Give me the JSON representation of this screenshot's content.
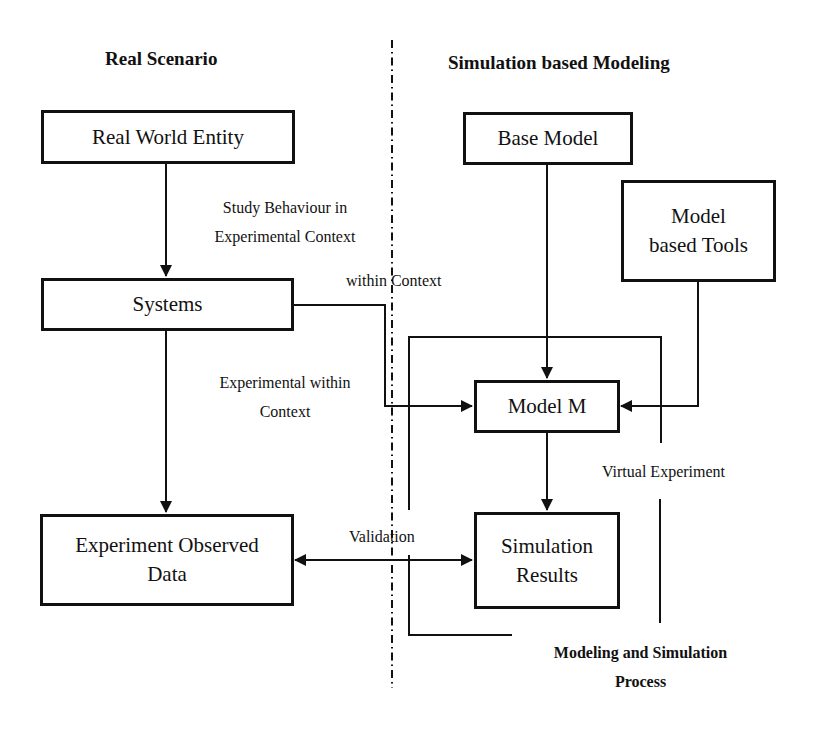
{
  "headings": {
    "left": "Real Scenario",
    "right": "Simulation based Modeling"
  },
  "boxes": {
    "real_world_entity": "Real World Entity",
    "systems": "Systems",
    "experiment_observed_data_line1": "Experiment Observed",
    "experiment_observed_data_line2": "Data",
    "base_model": "Base Model",
    "model_based_tools_line1": "Model",
    "model_based_tools_line2": "based Tools",
    "model_m": "Model M",
    "simulation_results_line1": "Simulation",
    "simulation_results_line2": "Results"
  },
  "edge_labels": {
    "study_behaviour_line1": "Study Behaviour in",
    "study_behaviour_line2": "Experimental Context",
    "within_context": "within Context",
    "experimental_within_line1": "Experimental within",
    "experimental_within_line2": "Context",
    "validation": "Validation",
    "virtual_experiment": "Virtual Experiment",
    "process_line1": "Modeling and Simulation",
    "process_line2": "Process"
  },
  "colors": {
    "stroke": "#111111",
    "background": "#ffffff"
  }
}
